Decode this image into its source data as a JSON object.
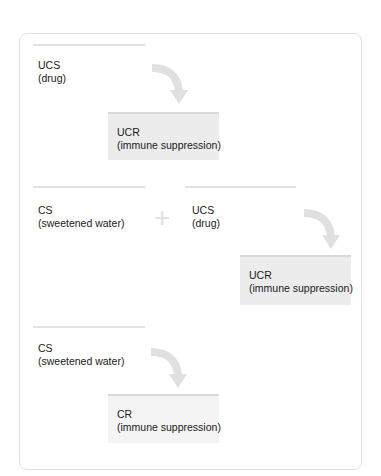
{
  "diagram": {
    "stages": [
      {
        "name": "before-conditioning",
        "stimulus": {
          "term": "UCS",
          "desc": "(drug)"
        },
        "response": {
          "term": "UCR",
          "desc": "(immune suppression)"
        }
      },
      {
        "name": "during-conditioning",
        "stimulus_a": {
          "term": "CS",
          "desc": "(sweetened water)"
        },
        "operator": "+",
        "stimulus_b": {
          "term": "UCS",
          "desc": "(drug)"
        },
        "response": {
          "term": "UCR",
          "desc": "(immune suppression)"
        }
      },
      {
        "name": "after-conditioning",
        "stimulus": {
          "term": "CS",
          "desc": "(sweetened water)"
        },
        "response": {
          "term": "CR",
          "desc": "(immune suppression)"
        }
      }
    ]
  },
  "colors": {
    "rule": "#e3e3e3",
    "box_fill": "#ececec",
    "box_fill_light": "#f4f4f4",
    "arrow": "#e0e0e0",
    "card_border": "#e2e2e2"
  }
}
